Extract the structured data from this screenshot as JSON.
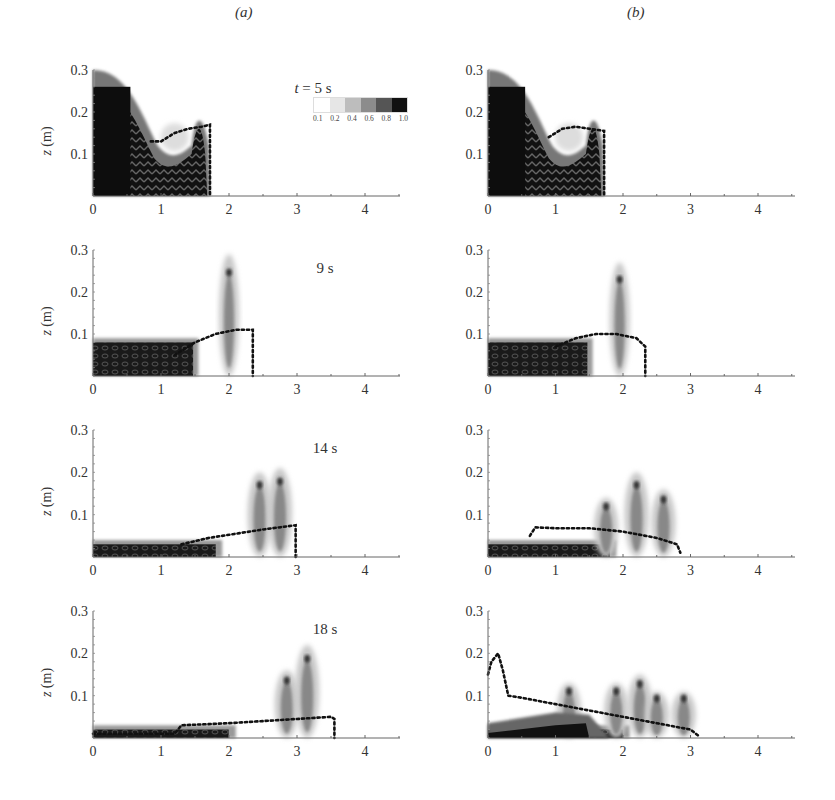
{
  "figure": {
    "column_labels": [
      "(a)",
      "(b)"
    ],
    "time_labels": [
      "t = 5 s",
      "9 s",
      "14 s",
      "18 s"
    ],
    "ylabel": "z (m)",
    "colorbar": {
      "ticks": [
        "0.1",
        "0.2",
        "0.4",
        "0.6",
        "0.8",
        "1.0"
      ],
      "colors": [
        "#ffffff",
        "#e6e6e6",
        "#bdbdbd",
        "#8c8c8c",
        "#555555",
        "#111111"
      ]
    }
  },
  "chart_data": [
    {
      "type": "heatmap",
      "title": "(a) t = 5 s",
      "xlabel": "",
      "ylabel": "z (m)",
      "xlim": [
        0,
        4.5
      ],
      "ylim": [
        0,
        0.3
      ],
      "xticks": [
        0,
        1,
        2,
        3,
        4
      ],
      "yticks": [
        0.1,
        0.2,
        0.3
      ],
      "front_profile": {
        "x": [
          0,
          0.3,
          0.6,
          0.9,
          1.0,
          1.2,
          1.5,
          1.72,
          1.72
        ],
        "z": [
          0.3,
          0.28,
          0.22,
          0.14,
          0.13,
          0.15,
          0.16,
          0.17,
          0
        ]
      },
      "dotted_line": {
        "x": [
          0.85,
          1.0,
          1.2,
          1.4,
          1.6,
          1.72,
          1.72
        ],
        "z": [
          0.13,
          0.13,
          0.15,
          0.16,
          0.165,
          0.17,
          0
        ]
      }
    },
    {
      "type": "heatmap",
      "title": "(b) t = 5 s",
      "xlabel": "",
      "ylabel": "",
      "xlim": [
        0,
        4.5
      ],
      "ylim": [
        0,
        0.3
      ],
      "xticks": [
        0,
        1,
        2,
        3,
        4
      ],
      "yticks": [
        0.1,
        0.2,
        0.3
      ],
      "front_profile": {
        "x": [
          0,
          0.3,
          0.6,
          0.9,
          1.0,
          1.2,
          1.5,
          1.72,
          1.72
        ],
        "z": [
          0.3,
          0.28,
          0.22,
          0.14,
          0.13,
          0.15,
          0.16,
          0.17,
          0
        ]
      },
      "dotted_line": {
        "x": [
          0.9,
          1.1,
          1.3,
          1.5,
          1.72,
          1.72
        ],
        "z": [
          0.14,
          0.16,
          0.165,
          0.16,
          0.155,
          0
        ]
      }
    },
    {
      "type": "heatmap",
      "title": "(a) t = 9 s",
      "xlim": [
        0,
        4.5
      ],
      "ylim": [
        0,
        0.3
      ],
      "xticks": [
        0,
        1,
        2,
        3,
        4
      ],
      "yticks": [
        0.1,
        0.2,
        0.3
      ],
      "peak": {
        "x": 2.0,
        "z": 0.29
      },
      "dotted_line": {
        "x": [
          1.2,
          1.5,
          1.8,
          2.1,
          2.35,
          2.35
        ],
        "z": [
          0.05,
          0.08,
          0.1,
          0.11,
          0.11,
          0
        ]
      }
    },
    {
      "type": "heatmap",
      "title": "(b) t = 9 s",
      "xlim": [
        0,
        4.5
      ],
      "ylim": [
        0,
        0.3
      ],
      "xticks": [
        0,
        1,
        2,
        3,
        4
      ],
      "yticks": [
        0.1,
        0.2,
        0.3
      ],
      "peak": {
        "x": 1.95,
        "z": 0.27
      },
      "dotted_line": {
        "x": [
          1.0,
          1.3,
          1.6,
          1.9,
          2.2,
          2.33,
          2.33
        ],
        "z": [
          0.07,
          0.09,
          0.1,
          0.1,
          0.09,
          0.07,
          0
        ]
      }
    },
    {
      "type": "heatmap",
      "title": "(a) t = 14 s",
      "xlim": [
        0,
        4.5
      ],
      "ylim": [
        0,
        0.3
      ],
      "xticks": [
        0,
        1,
        2,
        3,
        4
      ],
      "yticks": [
        0.1,
        0.2,
        0.3
      ],
      "peaks": [
        {
          "x": 2.45,
          "z": 0.2
        },
        {
          "x": 2.75,
          "z": 0.21
        }
      ],
      "dotted_line": {
        "x": [
          1.3,
          1.7,
          2.1,
          2.5,
          2.98,
          2.98
        ],
        "z": [
          0.03,
          0.045,
          0.055,
          0.065,
          0.075,
          0
        ]
      }
    },
    {
      "type": "heatmap",
      "title": "(b) t = 14 s",
      "xlim": [
        0,
        4.5
      ],
      "ylim": [
        0,
        0.3
      ],
      "xticks": [
        0,
        1,
        2,
        3,
        4
      ],
      "yticks": [
        0.1,
        0.2,
        0.3
      ],
      "peaks": [
        {
          "x": 1.75,
          "z": 0.14
        },
        {
          "x": 2.2,
          "z": 0.2
        },
        {
          "x": 2.6,
          "z": 0.16
        }
      ],
      "dotted_line": {
        "x": [
          0.62,
          0.7,
          1.0,
          1.5,
          2.0,
          2.5,
          2.8,
          2.85
        ],
        "z": [
          0.05,
          0.07,
          0.068,
          0.068,
          0.06,
          0.045,
          0.03,
          0.01
        ]
      }
    },
    {
      "type": "heatmap",
      "title": "(a) t = 18 s",
      "xlim": [
        0,
        4.5
      ],
      "ylim": [
        0,
        0.3
      ],
      "xticks": [
        0,
        1,
        2,
        3,
        4
      ],
      "yticks": [
        0.1,
        0.2,
        0.3
      ],
      "peaks": [
        {
          "x": 2.85,
          "z": 0.16
        },
        {
          "x": 3.15,
          "z": 0.22
        }
      ],
      "dotted_line": {
        "x": [
          0,
          1.2,
          1.3,
          2.0,
          2.5,
          3.0,
          3.5,
          3.55,
          3.55
        ],
        "z": [
          0.01,
          0.01,
          0.03,
          0.035,
          0.04,
          0.045,
          0.05,
          0.045,
          0
        ]
      }
    },
    {
      "type": "heatmap",
      "title": "(b) t = 18 s",
      "xlim": [
        0,
        4.5
      ],
      "ylim": [
        0,
        0.3
      ],
      "xticks": [
        0,
        1,
        2,
        3,
        4
      ],
      "yticks": [
        0.1,
        0.2,
        0.3
      ],
      "peaks": [
        {
          "x": 1.2,
          "z": 0.13
        },
        {
          "x": 1.9,
          "z": 0.13
        },
        {
          "x": 2.25,
          "z": 0.15
        },
        {
          "x": 2.5,
          "z": 0.11
        },
        {
          "x": 2.9,
          "z": 0.11
        }
      ],
      "dotted_line": {
        "x": [
          0,
          0.05,
          0.1,
          0.15,
          0.22,
          0.3,
          0.5,
          1.0,
          1.5,
          2.0,
          2.5,
          3.0,
          3.12
        ],
        "z": [
          0.15,
          0.18,
          0.19,
          0.2,
          0.16,
          0.1,
          0.095,
          0.08,
          0.065,
          0.05,
          0.035,
          0.02,
          0.005
        ]
      }
    }
  ]
}
